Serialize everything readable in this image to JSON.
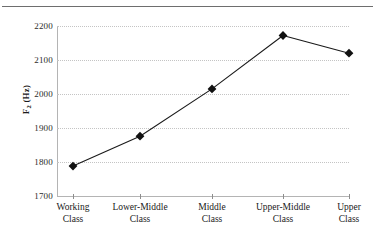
{
  "page": {
    "running_head": "",
    "rule_color": "#6e6e6e"
  },
  "figure": {
    "background": "#ffffff",
    "grid_color": "#c4c4c4",
    "axis_color": "#b4b4b4",
    "series_color": "#1a1a1a",
    "marker_shape": "diamond"
  },
  "chart_data": {
    "type": "line",
    "title": "",
    "xlabel": "",
    "ylabel": "F2 (Hz)",
    "ylabel_base": "F",
    "ylabel_sub": "2",
    "ylabel_unit": " (Hz)",
    "categories": [
      "Working Class",
      "Lower-Middle Class",
      "Middle Class",
      "Upper-Middle Class",
      "Upper Class"
    ],
    "category_lines": [
      [
        "Working",
        "Class"
      ],
      [
        "Lower-Middle",
        "Class"
      ],
      [
        "Middle",
        "Class"
      ],
      [
        "Upper-Middle",
        "Class"
      ],
      [
        "Upper",
        "Class"
      ]
    ],
    "values": [
      1788,
      1876,
      2015,
      2172,
      2120
    ],
    "ylim": [
      1700,
      2200
    ],
    "ytick_values": [
      2200,
      2100,
      2000,
      1900,
      1800,
      1700
    ],
    "ytick_labels": [
      "2200",
      "2100",
      "2000",
      "1900",
      "1800",
      "1700"
    ],
    "grid": "horizontal-dotted",
    "legend": "none",
    "marker": "filled-diamond"
  }
}
